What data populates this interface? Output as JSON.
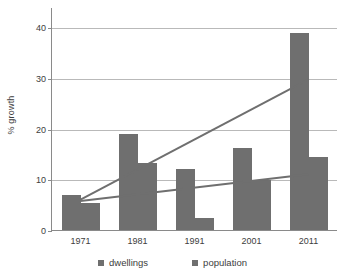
{
  "chart_data": {
    "type": "bar",
    "title": "",
    "subtitle": "",
    "xlabel": "",
    "ylabel": "% growth",
    "categories": [
      "1971",
      "1981",
      "1991",
      "2001",
      "2011"
    ],
    "ylim": [
      0,
      42
    ],
    "yticks": [
      0,
      10,
      20,
      30,
      40
    ],
    "ytick_labels": [
      "0",
      "10",
      "20",
      "30",
      "40"
    ],
    "grid": true,
    "legend_position": "bottom",
    "series": [
      {
        "name": "dwellings",
        "color": "#6f6f6f",
        "values": [
          7.0,
          19.0,
          12.1,
          16.2,
          38.9
        ]
      },
      {
        "name": "population",
        "color": "#6f6f6f",
        "values": [
          5.3,
          13.2,
          2.3,
          9.8,
          14.3
        ]
      }
    ],
    "trendlines": [
      {
        "name": "dwellings-trend",
        "color": "#6f6f6f",
        "x": [
          "1971",
          "2011"
        ],
        "y": [
          6.2,
          29.9
        ]
      },
      {
        "name": "population-trend",
        "color": "#6f6f6f",
        "x": [
          "1971",
          "2011"
        ],
        "y": [
          5.9,
          11.2
        ]
      }
    ]
  },
  "legend": {
    "items": [
      {
        "label": "dwellings"
      },
      {
        "label": "population"
      }
    ]
  }
}
